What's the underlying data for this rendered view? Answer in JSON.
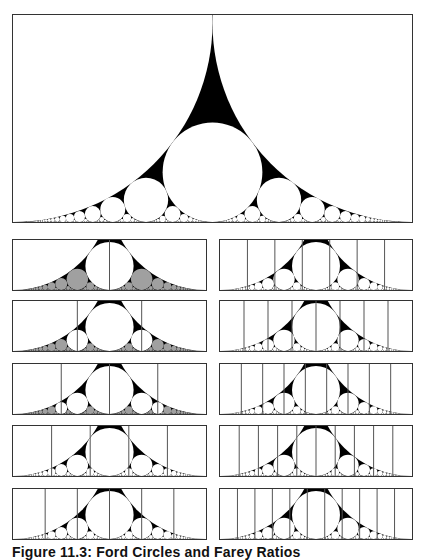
{
  "figure": {
    "caption": "Figure 11.3: Ford Circles and Farey Ratios",
    "colors": {
      "gap": "#000000",
      "circle": "#ffffff",
      "shaded_circle": "#a0a0a0",
      "divider": "#555555",
      "frame": "#333333"
    }
  },
  "main_panel": {
    "x_range": [
      0,
      1
    ],
    "y_max": 0.52,
    "max_denominator": 60
  },
  "small_panels": [
    {
      "column": "left",
      "row": 0,
      "divisions": 2,
      "shade_above_q": 2
    },
    {
      "column": "left",
      "row": 1,
      "divisions": 3,
      "shade_above_q": 3
    },
    {
      "column": "left",
      "row": 2,
      "divisions": 4,
      "shade_above_q": 4
    },
    {
      "column": "left",
      "row": 3,
      "divisions": 5,
      "shade_above_q": 99
    },
    {
      "column": "left",
      "row": 4,
      "divisions": 6,
      "shade_above_q": 99
    },
    {
      "column": "right",
      "row": 0,
      "divisions": 7,
      "shade_above_q": 99
    },
    {
      "column": "right",
      "row": 1,
      "divisions": 8,
      "shade_above_q": 99
    },
    {
      "column": "right",
      "row": 2,
      "divisions": 9,
      "shade_above_q": 99
    },
    {
      "column": "right",
      "row": 3,
      "divisions": 10,
      "shade_above_q": 99
    },
    {
      "column": "right",
      "row": 4,
      "divisions": 11,
      "shade_above_q": 99
    }
  ],
  "chart_data": {
    "type": "diagram",
    "title": "Figure 11.3: Ford Circles and Farey Ratios",
    "main": {
      "x_range": [
        0,
        1
      ],
      "y_range": [
        0,
        0.52
      ],
      "largest_circles": [
        "0/1",
        "1/1",
        "1/2",
        "1/3",
        "2/3"
      ]
    },
    "small_panels_divisions": {
      "left": [
        2,
        3,
        4,
        5,
        6
      ],
      "right": [
        7,
        8,
        9,
        10,
        11
      ]
    },
    "small_panel_y_range": [
      0,
      0.26
    ]
  }
}
